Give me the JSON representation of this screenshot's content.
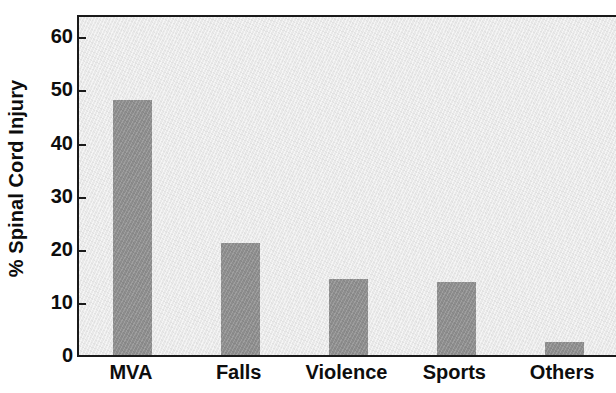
{
  "chart_data": {
    "type": "bar",
    "title": "",
    "subtitle": "",
    "xlabel": "",
    "ylabel": "% Spinal Cord Injury",
    "categories": [
      "MVA",
      "Falls",
      "Violence",
      "Sports",
      "Others"
    ],
    "values": [
      48,
      21,
      14.4,
      13.7,
      2.5
    ],
    "ylim": [
      0,
      64
    ],
    "yticks": [
      0,
      10,
      20,
      30,
      40,
      50,
      60
    ],
    "ytick_labels": [
      "0",
      "10",
      "20",
      "30",
      "40",
      "50",
      "60"
    ],
    "grid": false,
    "legend": false,
    "legend_position": "none",
    "bar_color": "#8d8d8d",
    "plot_background": "#e9e9e9",
    "axis_color": "#1a1a1a",
    "text_color": "#0d0d0d",
    "annotations": []
  }
}
